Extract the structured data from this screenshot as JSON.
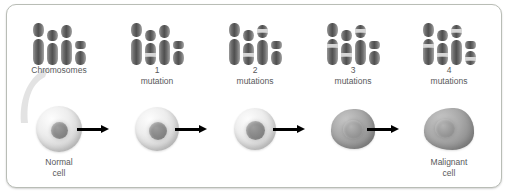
{
  "figure": {
    "border_color": "#b9bdb6",
    "label_color": "#58595b",
    "arrow_color": "#000000",
    "chromosome_color": "#4f4f4f",
    "mutation_band_color": "#d6d6d6"
  },
  "stages": [
    {
      "id": "stage-normal",
      "label_num": "",
      "label_text": "Chromosomes",
      "cell_label_line1": "Normal",
      "cell_label_line2": "cell",
      "mutation_count": 0,
      "chromosomes": [
        {
          "top_h": 14,
          "bot_h": 26,
          "bands": []
        },
        {
          "top_h": 11,
          "bot_h": 22,
          "bands": []
        },
        {
          "top_h": 13,
          "bot_h": 25,
          "bands": []
        },
        {
          "top_h": 8,
          "bot_h": 14,
          "bands": []
        }
      ]
    },
    {
      "id": "stage-1",
      "label_num": "1",
      "label_text": "mutation",
      "cell_label_line1": "",
      "cell_label_line2": "",
      "mutation_count": 1,
      "chromosomes": [
        {
          "top_h": 14,
          "bot_h": 26,
          "bands": []
        },
        {
          "top_h": 11,
          "bot_h": 22,
          "bands": [
            9
          ]
        },
        {
          "top_h": 13,
          "bot_h": 25,
          "bands": []
        },
        {
          "top_h": 8,
          "bot_h": 14,
          "bands": []
        }
      ]
    },
    {
      "id": "stage-2",
      "label_num": "2",
      "label_text": "mutations",
      "cell_label_line1": "",
      "cell_label_line2": "",
      "mutation_count": 2,
      "chromosomes": [
        {
          "top_h": 14,
          "bot_h": 26,
          "bands": []
        },
        {
          "top_h": 11,
          "bot_h": 22,
          "bands": [
            9
          ]
        },
        {
          "top_h": 13,
          "bot_h": 25,
          "bands": [
            4
          ]
        },
        {
          "top_h": 8,
          "bot_h": 14,
          "bands": []
        }
      ]
    },
    {
      "id": "stage-3",
      "label_num": "3",
      "label_text": "mutations",
      "cell_label_line1": "",
      "cell_label_line2": "",
      "mutation_count": 3,
      "chromosomes": [
        {
          "top_h": 14,
          "bot_h": 26,
          "bands": [
            7
          ]
        },
        {
          "top_h": 11,
          "bot_h": 22,
          "bands": [
            9
          ]
        },
        {
          "top_h": 13,
          "bot_h": 25,
          "bands": [
            4
          ]
        },
        {
          "top_h": 8,
          "bot_h": 14,
          "bands": []
        }
      ]
    },
    {
      "id": "stage-4",
      "label_num": "4",
      "label_text": "mutations",
      "cell_label_line1": "Malignant",
      "cell_label_line2": "cell",
      "mutation_count": 4,
      "chromosomes": [
        {
          "top_h": 14,
          "bot_h": 26,
          "bands": [
            7
          ]
        },
        {
          "top_h": 11,
          "bot_h": 22,
          "bands": [
            9
          ]
        },
        {
          "top_h": 13,
          "bot_h": 25,
          "bands": [
            4
          ]
        },
        {
          "top_h": 8,
          "bot_h": 14,
          "bands": [
            5
          ]
        }
      ]
    }
  ],
  "arrows": [
    {
      "id": "arrow-1"
    },
    {
      "id": "arrow-2"
    },
    {
      "id": "arrow-3"
    },
    {
      "id": "arrow-4"
    }
  ]
}
